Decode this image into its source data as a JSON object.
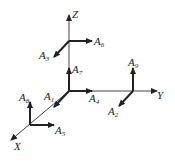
{
  "diagram": {
    "axes": {
      "x_label": "X",
      "y_label": "Y",
      "z_label": "Z"
    },
    "vectors": [
      {
        "name": "A",
        "sub": "1"
      },
      {
        "name": "A",
        "sub": "2"
      },
      {
        "name": "A",
        "sub": "3"
      },
      {
        "name": "A",
        "sub": "4"
      },
      {
        "name": "A",
        "sub": "5"
      },
      {
        "name": "A",
        "sub": "6"
      },
      {
        "name": "A",
        "sub": "7"
      },
      {
        "name": "A",
        "sub": "8"
      },
      {
        "name": "A",
        "sub": "9"
      }
    ],
    "line_color": "#333333"
  }
}
